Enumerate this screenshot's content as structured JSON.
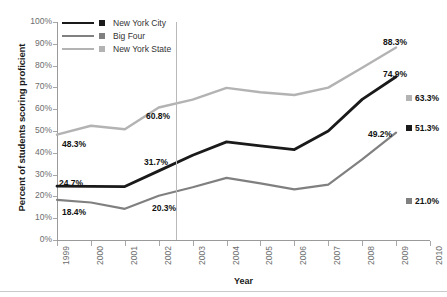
{
  "chart_data": {
    "type": "line",
    "title": "",
    "xlabel": "Year",
    "ylabel": "Percent of students scoring proficient",
    "x": [
      1999,
      2000,
      2001,
      2002,
      2003,
      2004,
      2005,
      2006,
      2007,
      2008,
      2009,
      2010
    ],
    "xlim": [
      1999,
      2010
    ],
    "ylim": [
      0,
      100
    ],
    "y_ticks": [
      "0%",
      "10%",
      "20%",
      "30%",
      "40%",
      "50%",
      "60%",
      "70%",
      "80%",
      "90%",
      "100%"
    ],
    "y_tick_values": [
      0,
      10,
      20,
      30,
      40,
      50,
      60,
      70,
      80,
      90,
      100
    ],
    "x_ticks": [
      "1999",
      "2000",
      "2001",
      "2002",
      "2003",
      "2004",
      "2005",
      "2006",
      "2007",
      "2008",
      "2009",
      "2010"
    ],
    "grid": false,
    "legend_position": "top-left",
    "series": [
      {
        "name": "New York City",
        "color": "#1a1a1a",
        "x": [
          1999,
          2000,
          2001,
          2002,
          2003,
          2004,
          2005,
          2006,
          2007,
          2008,
          2009
        ],
        "values": [
          24.7,
          24.6,
          24.5,
          31.7,
          38.9,
          45.0,
          43.2,
          41.5,
          50.0,
          64.5,
          74.9
        ]
      },
      {
        "name": "Big Four",
        "color": "#808080",
        "x": [
          1999,
          2000,
          2001,
          2002,
          2003,
          2004,
          2005,
          2006,
          2007,
          2008,
          2009
        ],
        "values": [
          18.4,
          17.2,
          14.3,
          20.3,
          24.2,
          28.5,
          26.0,
          23.2,
          25.4,
          37.0,
          49.2
        ]
      },
      {
        "name": "New York State",
        "color": "#b3b3b3",
        "x": [
          1999,
          2000,
          2001,
          2002,
          2003,
          2004,
          2005,
          2006,
          2007,
          2008,
          2009
        ],
        "values": [
          48.3,
          52.4,
          50.8,
          60.8,
          64.4,
          69.8,
          67.8,
          66.5,
          69.9,
          79.0,
          88.3
        ]
      }
    ],
    "annotations": [
      {
        "text": "48.3%",
        "series": "New York State",
        "year": 1999
      },
      {
        "text": "24.7%",
        "series": "New York City",
        "year": 1999
      },
      {
        "text": "18.4%",
        "series": "Big Four",
        "year": 1999
      },
      {
        "text": "60.8%",
        "series": "New York State",
        "year": 2002
      },
      {
        "text": "31.7%",
        "series": "New York City",
        "year": 2002
      },
      {
        "text": "20.3%",
        "series": "Big Four",
        "year": 2002
      },
      {
        "text": "88.3%",
        "series": "New York State",
        "year": 2009
      },
      {
        "text": "74.9%",
        "series": "New York City",
        "year": 2009
      },
      {
        "text": "49.2%",
        "series": "Big Four",
        "year": 2009
      }
    ],
    "edge_labels": [
      {
        "text": "63.3%",
        "series": "New York State",
        "color": "#b3b3b3"
      },
      {
        "text": "51.3%",
        "series": "New York City",
        "color": "#1a1a1a"
      },
      {
        "text": "21.0%",
        "series": "Big Four",
        "color": "#808080"
      }
    ],
    "reference_line": {
      "between": [
        2002,
        2003
      ],
      "color": "#b9b9b9"
    }
  },
  "legend": {
    "items": [
      {
        "label": "New York City",
        "color": "#1a1a1a",
        "line_width": "2.6px"
      },
      {
        "label": "Big Four",
        "color": "#808080",
        "line_width": "2.2px"
      },
      {
        "label": "New York State",
        "color": "#b3b3b3",
        "line_width": "2.2px"
      }
    ]
  },
  "axes": {
    "y_title": "Percent of students scoring proficient",
    "x_title": "Year",
    "y_labels": [
      "100%",
      "90%",
      "80%",
      "70%",
      "60%",
      "50%",
      "40%",
      "30%",
      "20%",
      "10%",
      "0%"
    ],
    "x_labels": [
      "1999",
      "2000",
      "2001",
      "2002",
      "2003",
      "2004",
      "2005",
      "2006",
      "2007",
      "2008",
      "2009",
      "2010"
    ]
  },
  "annotations_inline": [
    {
      "text": "48.3%"
    },
    {
      "text": "24.7%"
    },
    {
      "text": "18.4%"
    },
    {
      "text": "60.8%"
    },
    {
      "text": "31.7%"
    },
    {
      "text": "20.3%"
    },
    {
      "text": "88.3%"
    },
    {
      "text": "74.9%"
    },
    {
      "text": "49.2%"
    }
  ],
  "edge_labels_list": [
    {
      "text": "63.3%"
    },
    {
      "text": "51.3%"
    },
    {
      "text": "21.0%"
    }
  ]
}
